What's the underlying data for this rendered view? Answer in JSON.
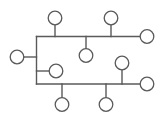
{
  "diagram": {
    "type": "tree-network",
    "background": "#ffffff",
    "stroke_color": "#5a5a5a",
    "node_radius": 6.8,
    "edges": [
      {
        "id": "trunk-vertical",
        "x1": 36.5,
        "y1": 36.5,
        "x2": 36.5,
        "y2": 84
      },
      {
        "id": "top-bus",
        "x1": 36.5,
        "y1": 36.5,
        "x2": 140,
        "y2": 36.5
      },
      {
        "id": "bottom-bus",
        "x1": 36.5,
        "y1": 84,
        "x2": 140,
        "y2": 84
      },
      {
        "id": "left-node-link",
        "x1": 24,
        "y1": 57,
        "x2": 36.5,
        "y2": 57
      },
      {
        "id": "inner-node-link",
        "x1": 36.5,
        "y1": 71,
        "x2": 49,
        "y2": 71
      },
      {
        "id": "top-left-stem",
        "x1": 55,
        "y1": 25,
        "x2": 55,
        "y2": 36.5
      },
      {
        "id": "top-right-stem",
        "x1": 111,
        "y1": 25,
        "x2": 111,
        "y2": 36.5
      },
      {
        "id": "middle-stem",
        "x1": 86,
        "y1": 36.5,
        "x2": 86,
        "y2": 48.5
      },
      {
        "id": "right-mid-stem",
        "x1": 122,
        "y1": 70,
        "x2": 122,
        "y2": 84
      },
      {
        "id": "bottom-left-stem",
        "x1": 62,
        "y1": 84,
        "x2": 62,
        "y2": 97.5
      },
      {
        "id": "bottom-right-stem",
        "x1": 106,
        "y1": 84,
        "x2": 106,
        "y2": 97.5
      }
    ],
    "nodes": [
      {
        "id": "top-left",
        "cx": 55,
        "cy": 18
      },
      {
        "id": "top-right",
        "cx": 111,
        "cy": 18
      },
      {
        "id": "right-top",
        "cx": 147,
        "cy": 36.5
      },
      {
        "id": "left",
        "cx": 17,
        "cy": 57
      },
      {
        "id": "middle",
        "cx": 86,
        "cy": 55.5
      },
      {
        "id": "inner-left",
        "cx": 56,
        "cy": 71
      },
      {
        "id": "right-mid",
        "cx": 122,
        "cy": 63
      },
      {
        "id": "right-bottom",
        "cx": 147,
        "cy": 84
      },
      {
        "id": "bottom-left",
        "cx": 62,
        "cy": 104.5
      },
      {
        "id": "bottom-right",
        "cx": 106,
        "cy": 104.5
      }
    ]
  }
}
